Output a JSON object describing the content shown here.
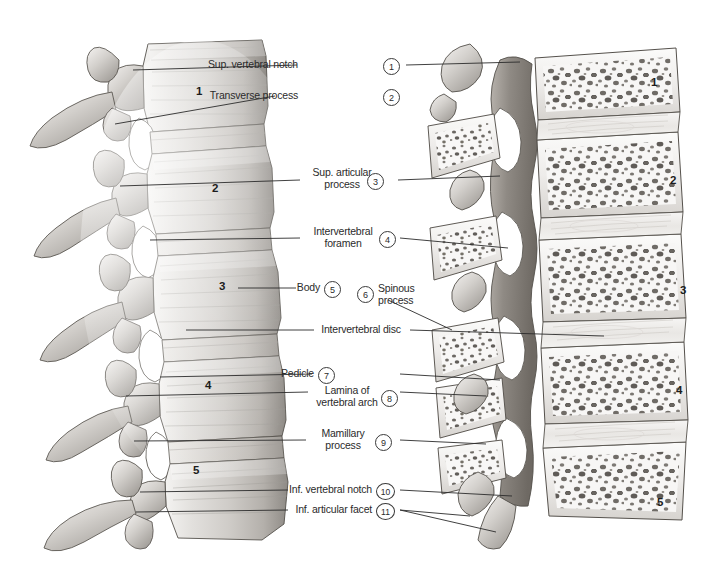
{
  "figure": {
    "kind": "anatomical-illustration",
    "left_panel": "Lateral view of lumbar vertebrae L1-L5",
    "right_panel": "Median (mid-sagittal) section of lumbar vertebrae showing trabecular bone",
    "background_color": "#ffffff",
    "ink_color": "#2b2b2b"
  },
  "keys": [
    {
      "n": "1",
      "text": "Sup. vertebral notch",
      "lines": [
        "Sup. vertebral notch"
      ]
    },
    {
      "n": "2",
      "text": "Transverse process",
      "lines": [
        "Transverse process"
      ]
    },
    {
      "n": "3",
      "text": "Sup. articular process",
      "lines": [
        "Sup. articular",
        "process"
      ]
    },
    {
      "n": "4",
      "text": "Intervertebral foramen",
      "lines": [
        "Intervertebral",
        "foramen"
      ]
    },
    {
      "n": "5",
      "text": "Body",
      "lines": [
        "Body"
      ]
    },
    {
      "n": "6",
      "text": "Spinous process",
      "lines": [
        "Spinous",
        "process"
      ]
    },
    {
      "n": "7",
      "text": "Pedicle",
      "lines": [
        "Pedicle"
      ]
    },
    {
      "n": "8",
      "text": "Lamina of vertebral arch",
      "lines": [
        "Lamina of",
        "vertebral arch"
      ]
    },
    {
      "n": "9",
      "text": "Mamillary process",
      "lines": [
        "Mamillary",
        "process"
      ]
    },
    {
      "n": "10",
      "text": "Inf. vertebral notch",
      "lines": [
        "Inf. vertebral notch"
      ]
    },
    {
      "n": "11",
      "text": "Inf. articular facet",
      "lines": [
        "Inf. articular facet"
      ]
    }
  ],
  "unnumbered_labels": [
    {
      "text": "Intervertebral disc"
    }
  ],
  "left_vertebra_numbers": [
    "1",
    "2",
    "3",
    "4",
    "5"
  ],
  "right_vertebra_numbers": [
    "1",
    "2",
    "3",
    "4",
    "5"
  ]
}
